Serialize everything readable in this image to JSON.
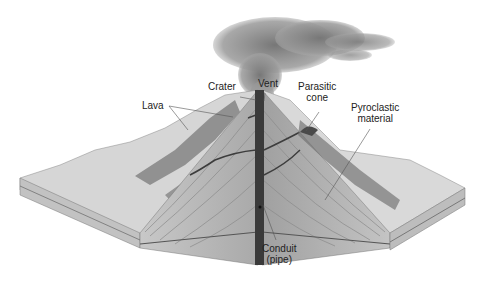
{
  "diagram": {
    "labels": {
      "crater": "Crater",
      "vent": "Vent",
      "parasitic_cone": "Parasitic\ncone",
      "lava": "Lava",
      "pyroclastic_material": "Pyroclastic\nmaterial",
      "conduit": "Conduit\n(pipe)"
    },
    "colors": {
      "ash_plume": "#8a8a8a",
      "surface": "#cfcfcf",
      "lava_flow": "#6a6a6a",
      "strata": "#b4b4b4",
      "conduit": "#3a3a3a",
      "leader_line": "#555555"
    }
  }
}
